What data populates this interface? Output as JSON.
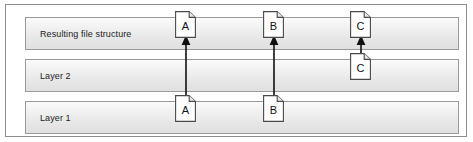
{
  "figure": {
    "frame_border_color": "#8d8d8d",
    "band_border_color": "#9a9a9a",
    "arrow_color": "#111111",
    "icon_fill": "#ffffff",
    "icon_border_color": "#4a4a4a"
  },
  "bands": [
    {
      "id": "resulting",
      "label": "Resulting file structure"
    },
    {
      "id": "layer2",
      "label": "Layer 2"
    },
    {
      "id": "layer1",
      "label": "Layer 1"
    }
  ],
  "files": [
    {
      "id": "result-a",
      "letter": "A",
      "band": "resulting",
      "icon": "file-document-icon"
    },
    {
      "id": "result-b",
      "letter": "B",
      "band": "resulting",
      "icon": "file-document-icon"
    },
    {
      "id": "result-c",
      "letter": "C",
      "band": "resulting",
      "icon": "file-document-icon"
    },
    {
      "id": "layer2-c",
      "letter": "C",
      "band": "layer2",
      "icon": "file-document-icon"
    },
    {
      "id": "layer1-a",
      "letter": "A",
      "band": "layer1",
      "icon": "file-document-icon"
    },
    {
      "id": "layer1-b",
      "letter": "B",
      "band": "layer1",
      "icon": "file-document-icon"
    }
  ],
  "arrows": [
    {
      "id": "arrow-a",
      "from": "layer1-a",
      "to": "result-a",
      "direction": "up"
    },
    {
      "id": "arrow-b",
      "from": "layer1-b",
      "to": "result-b",
      "direction": "up"
    },
    {
      "id": "arrow-c",
      "from": "layer2-c",
      "to": "result-c",
      "direction": "up"
    }
  ]
}
